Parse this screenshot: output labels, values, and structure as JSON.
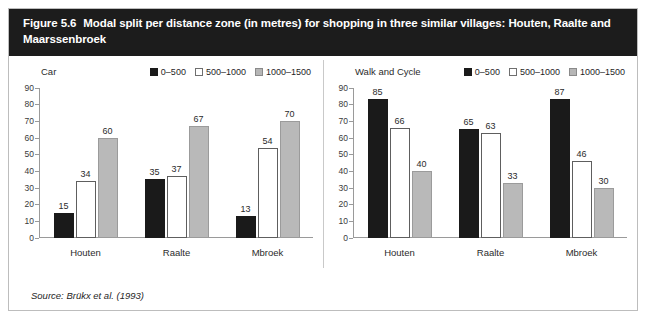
{
  "figure": {
    "number": "Figure 5.6",
    "title": "Modal split per distance zone (in metres) for shopping in three similar villages: Houten, Raalte and Maarssenbroek",
    "source": "Source: Brükx et al. (1993)"
  },
  "chart_data": [
    {
      "type": "bar",
      "title": "Car",
      "categories": [
        "Houten",
        "Raalte",
        "Mbroek"
      ],
      "series": [
        {
          "name": "0–500",
          "color": "#1a1a1a",
          "values": [
            15,
            35,
            13
          ]
        },
        {
          "name": "500–1000",
          "color": "#ffffff",
          "values": [
            34,
            37,
            54
          ]
        },
        {
          "name": "1000–1500",
          "color": "#b9b9b9",
          "values": [
            60,
            67,
            70
          ]
        }
      ],
      "xlabel": "",
      "ylabel": "",
      "ylim": [
        0,
        90
      ],
      "yticks": [
        90,
        80,
        70,
        60,
        50,
        40,
        30,
        20,
        10,
        0
      ],
      "grid": false,
      "legend_position": "top-right"
    },
    {
      "type": "bar",
      "title": "Walk and Cycle",
      "categories": [
        "Houten",
        "Raalte",
        "Mbroek"
      ],
      "series": [
        {
          "name": "0–500",
          "color": "#1a1a1a",
          "values": [
            85,
            65,
            87
          ]
        },
        {
          "name": "500–1000",
          "color": "#ffffff",
          "values": [
            66,
            63,
            46
          ]
        },
        {
          "name": "1000–1500",
          "color": "#b9b9b9",
          "values": [
            40,
            33,
            30
          ]
        }
      ],
      "xlabel": "",
      "ylabel": "",
      "ylim": [
        0,
        90
      ],
      "yticks": [
        90,
        80,
        70,
        60,
        50,
        40,
        30,
        20,
        10,
        0
      ],
      "grid": false,
      "legend_position": "top-right"
    }
  ]
}
